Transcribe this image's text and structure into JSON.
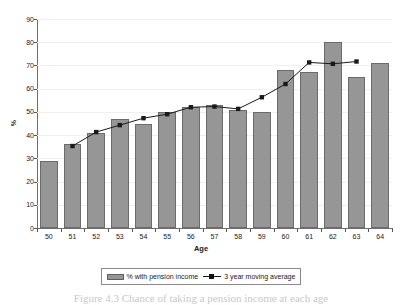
{
  "chart_data": {
    "type": "bar",
    "title": "",
    "xlabel": "Age",
    "ylabel": "%",
    "categories": [
      "50",
      "51",
      "52",
      "53",
      "54",
      "55",
      "56",
      "57",
      "58",
      "59",
      "60",
      "61",
      "62",
      "63",
      "64"
    ],
    "ylim": [
      0,
      90
    ],
    "ytick_step": 10,
    "yticks": [
      "90",
      "80",
      "70",
      "60",
      "50",
      "40",
      "30",
      "20",
      "10",
      "0"
    ],
    "grid": true,
    "legend_position": "bottom",
    "series": [
      {
        "name": "% with pension income",
        "kind": "bar",
        "color": "#969696",
        "values": [
          29,
          36,
          41,
          47,
          45,
          50,
          52,
          53,
          51,
          50,
          68,
          67,
          80,
          65,
          71
        ]
      },
      {
        "name": "3 year moving average",
        "kind": "line",
        "color": "#1a1a1a",
        "marker": "square",
        "values": [
          null,
          35.3,
          41.3,
          44.3,
          47.3,
          49.0,
          52.0,
          52.3,
          51.3,
          56.3,
          62.0,
          71.3,
          70.7,
          71.7,
          null
        ]
      }
    ]
  },
  "legend": {
    "items": [
      {
        "label": "% with pension income",
        "swatch": "bar-swatch-icon"
      },
      {
        "label": "3 year moving average",
        "swatch": "line-marker-icon"
      }
    ]
  },
  "axes": {
    "y_label": "%",
    "x_label": "Age"
  },
  "caption": "Figure 4.3  Chance of taking a pension income at each age"
}
